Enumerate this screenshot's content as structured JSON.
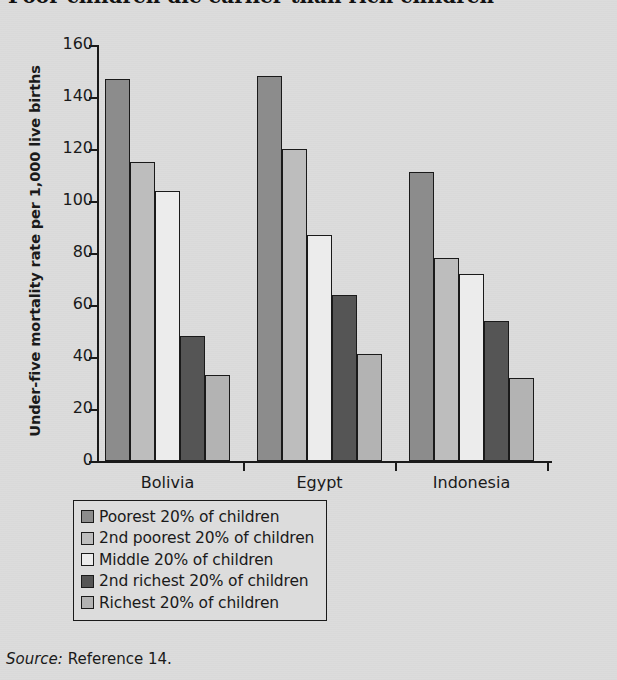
{
  "chart_title": "Poor children die earlier than rich children",
  "y_axis_title": "Under-five mortality rate per 1,000 live births",
  "source": {
    "label": "Source:",
    "text": "Reference 14."
  },
  "colors": {
    "background": "#dcdcdc",
    "axis": "#1a1a1a",
    "poorest": "#8c8c8c",
    "second_poorest": "#bdbdbd",
    "middle": "#ececec",
    "second_richest": "#555555",
    "richest": "#b3b3b3"
  },
  "chart_data": {
    "type": "bar",
    "title": "Poor children die earlier than rich children",
    "xlabel": "",
    "ylabel": "Under-five mortality rate per 1,000 live births",
    "ylim": [
      0,
      160
    ],
    "yticks": [
      0,
      20,
      40,
      60,
      80,
      100,
      120,
      140,
      160
    ],
    "grid": false,
    "legend_position": "below-plot",
    "categories": [
      "Bolivia",
      "Egypt",
      "Indonesia"
    ],
    "series": [
      {
        "name": "Poorest 20% of children",
        "color": "#8c8c8c",
        "values": [
          147,
          148,
          111
        ]
      },
      {
        "name": "2nd poorest 20% of children",
        "color": "#bdbdbd",
        "values": [
          115,
          120,
          78
        ]
      },
      {
        "name": "Middle 20% of children",
        "color": "#ececec",
        "values": [
          104,
          87,
          72
        ]
      },
      {
        "name": "2nd richest 20% of children",
        "color": "#555555",
        "values": [
          48,
          64,
          54
        ]
      },
      {
        "name": "Richest 20% of children",
        "color": "#b3b3b3",
        "values": [
          33,
          41,
          32
        ]
      }
    ]
  }
}
